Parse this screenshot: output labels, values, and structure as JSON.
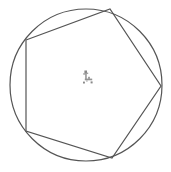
{
  "figure": {
    "title": "Circle with inscribed irregular pentagon",
    "background_color": "#ffffff",
    "stroke_color": "#555555",
    "smudge_color": "#8a8a8a",
    "width": 171,
    "height": 172,
    "circle": {
      "name": "circumscribed-circle",
      "center_x": 86,
      "center_y": 85,
      "radius": 76,
      "stroke_width": 1.2,
      "fill": "none"
    },
    "polygon": {
      "name": "inscribed-pentagon",
      "sides": 5,
      "stroke_width": 1.2,
      "fill": "none",
      "points": "26,40 110,9 161,86 112,158 26,131",
      "vertices": [
        {
          "label": "upper-left",
          "x": 26,
          "y": 40
        },
        {
          "label": "top",
          "x": 110,
          "y": 9
        },
        {
          "label": "right",
          "x": 161,
          "y": 86
        },
        {
          "label": "bottom",
          "x": 112,
          "y": 158
        },
        {
          "label": "lower-left",
          "x": 26,
          "y": 131
        }
      ]
    },
    "center_mark": {
      "name": "center-smudge-artifact",
      "x": 86,
      "y": 80,
      "description": "small gray scanning artifact near the circle center"
    }
  }
}
